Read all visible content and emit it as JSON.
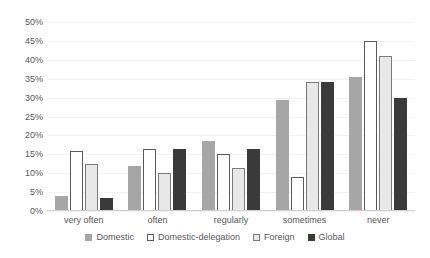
{
  "chart_data": {
    "type": "bar",
    "title": "",
    "subtitle": "",
    "xlabel": "",
    "ylabel": "",
    "ylim": [
      0,
      50
    ],
    "y_tick_step": 5,
    "y_ticks": [
      "0%",
      "5%",
      "10%",
      "15%",
      "20%",
      "25%",
      "30%",
      "35%",
      "40%",
      "45%",
      "50%"
    ],
    "grid": true,
    "legend_position": "bottom",
    "categories": [
      "very often",
      "often",
      "regularly",
      "sometimes",
      "never"
    ],
    "series": [
      {
        "name": "Domestic",
        "color": "#a6a6a6",
        "values": [
          4.0,
          12.0,
          18.5,
          29.5,
          35.5
        ]
      },
      {
        "name": "Domestic-delegation",
        "color": "#ffffff",
        "values": [
          16.0,
          16.5,
          15.0,
          9.0,
          45.0
        ]
      },
      {
        "name": "Foreign",
        "color": "#e8e8e8",
        "values": [
          12.5,
          10.0,
          11.5,
          34.0,
          41.0
        ]
      },
      {
        "name": "Global",
        "color": "#3a3a3a",
        "values": [
          3.5,
          16.5,
          16.5,
          34.0,
          30.0
        ]
      }
    ]
  }
}
